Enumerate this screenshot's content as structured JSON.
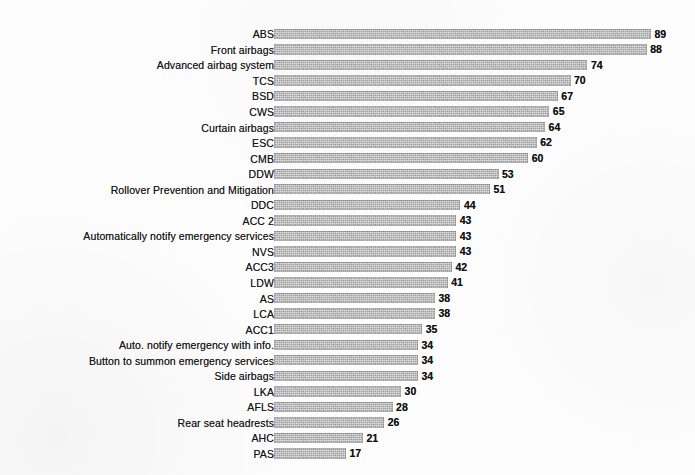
{
  "chart_data": {
    "type": "bar",
    "orientation": "horizontal",
    "title": "",
    "subtitle": "",
    "xlabel": "",
    "ylabel": "",
    "xlim": [
      0,
      89
    ],
    "grid": false,
    "legend": null,
    "data_labels": true,
    "bar_color": "#a6a6a6",
    "text_color": "#111111",
    "background_color": "#ffffff",
    "categories": [
      "ABS",
      "Front airbags",
      "Advanced airbag system",
      "TCS",
      "BSD",
      "CWS",
      "Curtain airbags",
      "ESC",
      "CMB",
      "DDW",
      "Rollover Prevention and Mitigation",
      "DDC",
      "ACC 2",
      "Automatically notify emergency services",
      "NVS",
      "ACC3",
      "LDW",
      "AS",
      "LCA",
      "ACC1",
      "Auto. notify emergency with info.",
      "Button to summon emergency services",
      "Side airbags",
      "LKA",
      "AFLS",
      "Rear seat headrests",
      "AHC",
      "PAS"
    ],
    "values": [
      89,
      88,
      74,
      70,
      67,
      65,
      64,
      62,
      60,
      53,
      51,
      44,
      43,
      43,
      43,
      42,
      41,
      38,
      38,
      35,
      34,
      34,
      34,
      30,
      28,
      26,
      21,
      17
    ]
  }
}
